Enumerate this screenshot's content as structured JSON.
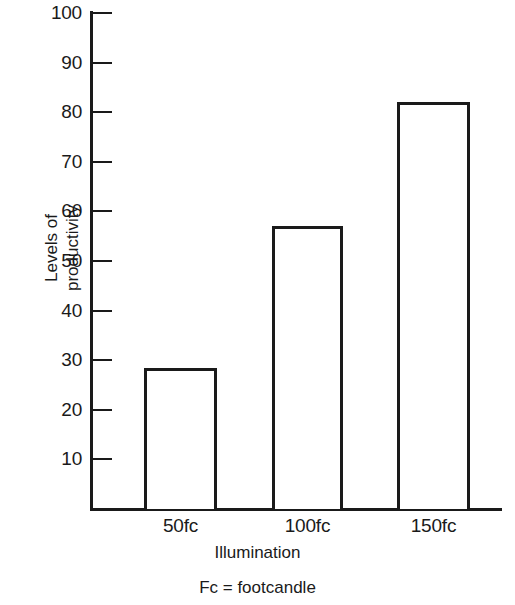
{
  "chart_data": {
    "type": "bar",
    "title": "",
    "subtitle": "",
    "categories": [
      "50fc",
      "100fc",
      "150fc"
    ],
    "values": [
      28.5,
      57,
      82
    ],
    "series": [
      {
        "name": "Levels of productivity",
        "values": [
          28.5,
          57,
          82
        ]
      }
    ],
    "xlabel": "Illumination",
    "ylabel": "Levels of productivity",
    "ylabel_lines": [
      "Levels of",
      "productivity"
    ],
    "ylim": [
      0,
      100
    ],
    "yticks": [
      100,
      90,
      80,
      70,
      60,
      50,
      40,
      30,
      20,
      10
    ],
    "ytick_labels": [
      "100",
      "90",
      "80",
      "70",
      "60",
      "50",
      "40",
      "30",
      "20",
      "10"
    ],
    "grid": false,
    "legend": "none",
    "bar_style": "outline",
    "bar_fill_color": "#ffffff",
    "bar_edge_color": "#1a1a1a",
    "axis_color": "#1a1a1a",
    "footnote": "Fc = footcandle"
  },
  "figure": {
    "y_axis_title_line1": "Levels of",
    "y_axis_title_line2": "productivity",
    "x_axis_title": "Illumination",
    "footnote": "Fc = footcandle"
  }
}
